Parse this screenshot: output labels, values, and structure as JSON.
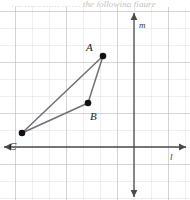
{
  "caption": {
    "cropped_text": "….  …… …… … … the  following figure"
  },
  "figure": {
    "axes": {
      "horizontal": {
        "name": "l",
        "label": "l",
        "y_px": 140,
        "arrow_both_ends": true
      },
      "vertical": {
        "name": "m",
        "label": "m",
        "x_px": 134,
        "arrow_both_ends": true
      }
    },
    "grid": {
      "visible": true,
      "cell_size_px": 17,
      "origin_px": {
        "x": 134,
        "y": 140
      },
      "color": "#c9c9c9"
    },
    "points": [
      {
        "id": "A",
        "label": "A",
        "x_px": 103,
        "y_px": 49,
        "grid_x": -1.8,
        "grid_y": 5.4
      },
      {
        "id": "B",
        "label": "B",
        "x_px": 88,
        "y_px": 96,
        "grid_x": -2.7,
        "grid_y": 2.6
      },
      {
        "id": "C",
        "label": "C",
        "x_px": 22,
        "y_px": 126,
        "grid_x": -6.6,
        "grid_y": 0.8
      }
    ],
    "segments": [
      {
        "id": "AB",
        "from": "A",
        "to": "B"
      },
      {
        "id": "BC",
        "from": "B",
        "to": "C"
      },
      {
        "id": "CA",
        "from": "C",
        "to": "A"
      }
    ],
    "colors": {
      "segment_stroke": "#6f6f78",
      "point_fill": "#111111",
      "axis_stroke": "#4a4a4a",
      "grid_minor": "#dedede",
      "grid_major": "#bdbdbd"
    }
  }
}
